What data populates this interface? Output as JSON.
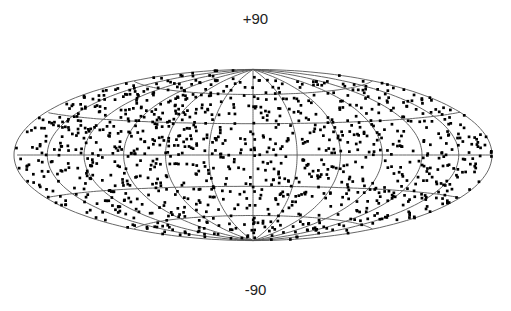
{
  "chart_data": {
    "type": "scatter",
    "projection": "hammer-aitoff",
    "title": "",
    "labels": {
      "top": "+90",
      "bottom": "-90"
    },
    "graticule": {
      "meridians_step_deg": 30,
      "parallels_deg": [
        -60,
        -30,
        0,
        30,
        60
      ]
    },
    "layout": {
      "cx": 253,
      "cy": 155,
      "rx": 239,
      "ry": 121
    },
    "colors": {
      "grid": "#555555",
      "point": "#000000",
      "background": "#ffffff"
    },
    "points_note": "Roughly 1100 point sources spread near-isotropically over the full sky, lon/lat in degrees",
    "points": [
      [
        -170,
        5
      ],
      [
        -168,
        -12
      ],
      [
        -165,
        22
      ],
      [
        -162,
        -30
      ],
      [
        -160,
        40
      ],
      [
        -158,
        -45
      ],
      [
        -156,
        10
      ],
      [
        -154,
        -3
      ],
      [
        -152,
        55
      ],
      [
        -150,
        -60
      ],
      [
        -148,
        18
      ],
      [
        -146,
        -22
      ],
      [
        -144,
        33
      ],
      [
        -142,
        -8
      ],
      [
        -140,
        48
      ],
      [
        -138,
        -38
      ],
      [
        -136,
        2
      ],
      [
        -134,
        -52
      ],
      [
        -132,
        27
      ],
      [
        -130,
        -15
      ],
      [
        -128,
        62
      ],
      [
        -126,
        -68
      ],
      [
        -124,
        12
      ],
      [
        -122,
        -28
      ],
      [
        -120,
        38
      ],
      [
        -118,
        -5
      ],
      [
        -116,
        50
      ],
      [
        -114,
        -42
      ],
      [
        -112,
        20
      ],
      [
        -110,
        -18
      ],
      [
        -108,
        70
      ],
      [
        -106,
        -72
      ],
      [
        -104,
        8
      ],
      [
        -102,
        -33
      ],
      [
        -100,
        30
      ],
      [
        -98,
        -10
      ],
      [
        -96,
        45
      ],
      [
        -94,
        -55
      ],
      [
        -92,
        15
      ],
      [
        -90,
        -25
      ],
      [
        -88,
        58
      ],
      [
        -86,
        -62
      ],
      [
        -84,
        3
      ],
      [
        -82,
        -40
      ],
      [
        -80,
        25
      ],
      [
        -78,
        -2
      ],
      [
        -76,
        42
      ],
      [
        -74,
        -48
      ],
      [
        -72,
        10
      ],
      [
        -70,
        -20
      ],
      [
        -68,
        66
      ],
      [
        -66,
        -65
      ],
      [
        -64,
        18
      ],
      [
        -62,
        -35
      ],
      [
        -60,
        35
      ],
      [
        -58,
        -12
      ],
      [
        -56,
        52
      ],
      [
        -54,
        -58
      ],
      [
        -52,
        6
      ],
      [
        -50,
        -30
      ],
      [
        -48,
        75
      ],
      [
        -46,
        -75
      ],
      [
        -44,
        22
      ],
      [
        -42,
        -15
      ],
      [
        -40,
        40
      ],
      [
        -38,
        -45
      ],
      [
        -36,
        12
      ],
      [
        -34,
        -5
      ],
      [
        -32,
        55
      ],
      [
        -30,
        -60
      ],
      [
        -28,
        28
      ],
      [
        -26,
        -25
      ],
      [
        -24,
        45
      ],
      [
        -22,
        -38
      ],
      [
        -20,
        8
      ],
      [
        -18,
        -18
      ],
      [
        -16,
        62
      ],
      [
        -14,
        -66
      ],
      [
        -12,
        15
      ],
      [
        -10,
        -8
      ],
      [
        -8,
        36
      ],
      [
        -6,
        -42
      ],
      [
        -4,
        80
      ],
      [
        -2,
        -80
      ],
      [
        0,
        20
      ],
      [
        2,
        -28
      ],
      [
        4,
        48
      ],
      [
        6,
        -52
      ],
      [
        8,
        5
      ],
      [
        10,
        -12
      ],
      [
        12,
        68
      ],
      [
        14,
        -70
      ],
      [
        16,
        25
      ],
      [
        18,
        -35
      ],
      [
        20,
        40
      ],
      [
        22,
        -2
      ],
      [
        24,
        56
      ],
      [
        26,
        -60
      ],
      [
        28,
        12
      ],
      [
        30,
        -22
      ],
      [
        32,
        72
      ],
      [
        34,
        -74
      ],
      [
        36,
        30
      ],
      [
        38,
        -15
      ],
      [
        40,
        44
      ],
      [
        42,
        -48
      ],
      [
        44,
        8
      ],
      [
        46,
        -32
      ],
      [
        48,
        58
      ],
      [
        50,
        -62
      ],
      [
        52,
        18
      ],
      [
        54,
        -8
      ],
      [
        56,
        38
      ],
      [
        58,
        -40
      ],
      [
        60,
        2
      ],
      [
        62,
        -20
      ],
      [
        64,
        64
      ],
      [
        66,
        -66
      ],
      [
        68,
        26
      ],
      [
        70,
        -28
      ],
      [
        72,
        46
      ],
      [
        74,
        -50
      ],
      [
        76,
        12
      ],
      [
        78,
        -5
      ],
      [
        80,
        54
      ],
      [
        82,
        -56
      ],
      [
        84,
        20
      ],
      [
        86,
        -36
      ],
      [
        88,
        34
      ],
      [
        90,
        -12
      ],
      [
        92,
        70
      ],
      [
        94,
        -70
      ],
      [
        96,
        6
      ],
      [
        98,
        -24
      ],
      [
        100,
        42
      ],
      [
        102,
        -44
      ],
      [
        104,
        16
      ],
      [
        106,
        -2
      ],
      [
        108,
        60
      ],
      [
        110,
        -60
      ],
      [
        112,
        28
      ],
      [
        114,
        -30
      ],
      [
        116,
        48
      ],
      [
        118,
        -50
      ],
      [
        120,
        10
      ],
      [
        122,
        -15
      ],
      [
        124,
        66
      ],
      [
        126,
        -64
      ],
      [
        128,
        22
      ],
      [
        130,
        -38
      ],
      [
        132,
        36
      ],
      [
        134,
        -10
      ],
      [
        136,
        52
      ],
      [
        138,
        -54
      ],
      [
        140,
        4
      ],
      [
        142,
        -26
      ],
      [
        144,
        74
      ],
      [
        146,
        -72
      ],
      [
        148,
        30
      ],
      [
        150,
        -20
      ],
      [
        152,
        44
      ],
      [
        154,
        -46
      ],
      [
        156,
        14
      ],
      [
        158,
        -4
      ],
      [
        160,
        58
      ],
      [
        162,
        -58
      ],
      [
        164,
        24
      ],
      [
        166,
        -34
      ],
      [
        168,
        38
      ],
      [
        170,
        -8
      ],
      [
        172,
        50
      ],
      [
        174,
        -48
      ],
      [
        176,
        16
      ],
      [
        178,
        -18
      ]
    ],
    "random_fill": {
      "count": 950,
      "seed": 7
    }
  }
}
